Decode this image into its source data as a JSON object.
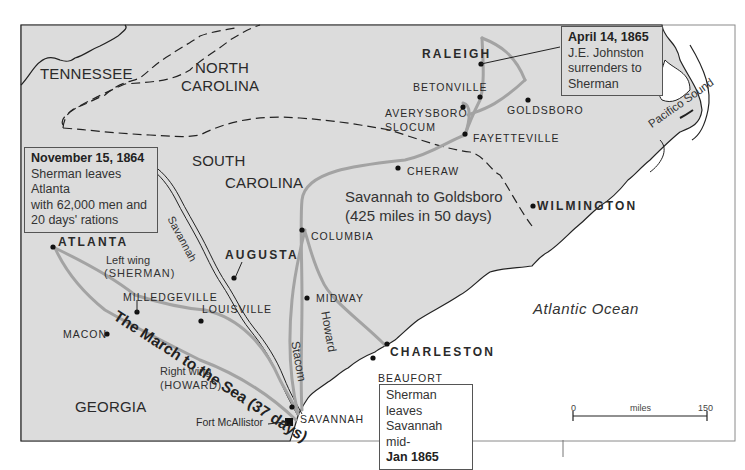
{
  "map": {
    "colors": {
      "land": "#dcdcdc",
      "ocean": "#ffffff",
      "route": "#a3a3a3",
      "border": "#222222",
      "frame": "#777777"
    },
    "states": [
      "TENNESSEE",
      "NORTH",
      "CAROLINA",
      "SOUTH",
      "CAROLINA",
      "GEORGIA"
    ],
    "state_labels": {
      "tennessee": "TENNESSEE",
      "nc_line1": "NORTH",
      "nc_line2": "CAROLINA",
      "sc_line1": "SOUTH",
      "sc_line2": "CAROLINA",
      "georgia": "GEORGIA"
    },
    "cities": {
      "atlanta": "ATLANTA",
      "augusta": "AUGUSTA",
      "raleigh": "RALEIGH",
      "wilmington": "WILMINGTON",
      "charleston": "CHARLESTON",
      "milledgeville": "MILLEDGEVILLE",
      "louisville": "LOUISVILLE",
      "macon": "MACON",
      "savannah": "SAVANNAH",
      "fort_mcallister": "Fort McAllistor",
      "beaufort": "BEAUFORT",
      "midway": "MIDWAY",
      "columbia": "COLUMBIA",
      "cheraw": "CHERAW",
      "fayetteville": "FAYETTEVILLE",
      "goldsboro": "GOLDSBORO",
      "betonville": "BETONVILLE",
      "averysboro": "AVERYSBORO",
      "slocum": "SLOCUM"
    },
    "water": {
      "river_savannah": "Savannah",
      "pacifico_sound": "Pacifico Sound",
      "atlantic": "Atlantic Ocean"
    },
    "routes": {
      "left_wing_1": "Left wing",
      "left_wing_2": "(SHERMAN)",
      "right_wing_1": "Right wing",
      "right_wing_2": "(HOWARD)",
      "march": "The March to the Sea (37 days)",
      "howard": "Howard",
      "stacom": "Stacom",
      "sav_gold_1": "Savannah to Goldsboro",
      "sav_gold_2": "(425 miles in 50 days)"
    },
    "notes": {
      "atlanta": {
        "title": "November 15, 1864",
        "lines": [
          "Sherman leaves",
          "Atlanta",
          "with 62,000 men and",
          "20 days' rations"
        ]
      },
      "raleigh": {
        "title": "April 14, 1865",
        "lines": [
          "J.E. Johnston",
          "surrenders to",
          "Sherman"
        ]
      },
      "savannah": {
        "lines": [
          "Sherman leaves",
          "Savannah mid-"
        ],
        "bold": "Jan 1865"
      }
    },
    "scale": {
      "min": "0",
      "unit": "miles",
      "max": "150"
    }
  }
}
